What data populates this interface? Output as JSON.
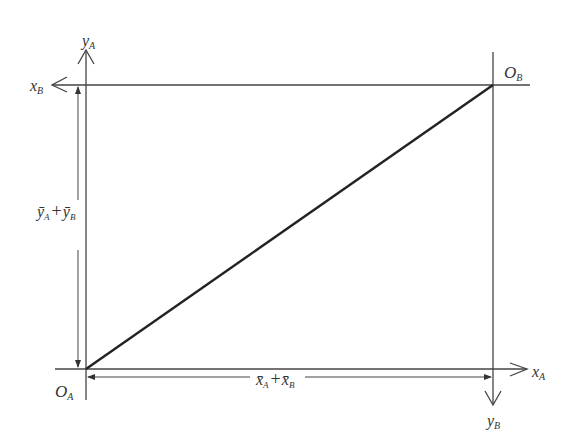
{
  "diagram": {
    "type": "edgeworth-box",
    "origins": {
      "a": "O",
      "a_sub": "A",
      "b": "O",
      "b_sub": "B"
    },
    "axes": {
      "x_a": {
        "var": "x",
        "sub": "A"
      },
      "y_a": {
        "var": "y",
        "sub": "A"
      },
      "x_b": {
        "var": "x",
        "sub": "B"
      },
      "y_b": {
        "var": "y",
        "sub": "B"
      }
    },
    "dimensions": {
      "width": {
        "v1": "x̄",
        "s1": "A",
        "op": "+",
        "v2": "x̄",
        "s2": "B"
      },
      "height": {
        "v1": "ȳ",
        "s1": "A",
        "op": "+",
        "v2": "ȳ",
        "s2": "B"
      }
    },
    "colors": {
      "line": "#333333",
      "contract_curve": "#222222"
    }
  }
}
